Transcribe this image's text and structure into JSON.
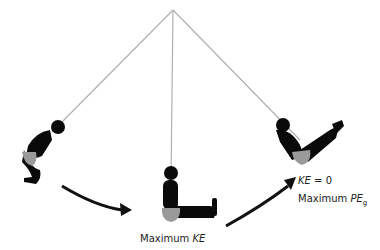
{
  "diagram": {
    "labels": {
      "bottom_prefix": "Maximum ",
      "bottom_var": "KE",
      "right_line1_var": "KE",
      "right_line1_rest": " = 0",
      "right_line2_prefix": "Maximum ",
      "right_line2_var": "PE",
      "right_line2_sub": "g"
    },
    "colors": {
      "rope": "#b0b0b0",
      "figure": "#0a0a0a",
      "seat": "#9a9a9a",
      "arrow": "#111111"
    },
    "positions": [
      "left-start",
      "bottom-maximum-KE",
      "right-maximum-PEg"
    ]
  }
}
